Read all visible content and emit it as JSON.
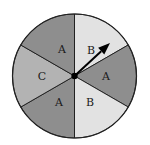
{
  "spinner": {
    "center": [
      74.5,
      76
    ],
    "radius": 62,
    "sectors": [
      {
        "label": "B",
        "start_deg": 0,
        "end_deg": 60,
        "color": "#e2e2e2",
        "label_pos": [
          91,
          50
        ]
      },
      {
        "label": "A",
        "start_deg": 60,
        "end_deg": 120,
        "color": "#8e8e8e",
        "label_pos": [
          106,
          76
        ]
      },
      {
        "label": "B",
        "start_deg": 120,
        "end_deg": 180,
        "color": "#e2e2e2",
        "label_pos": [
          90,
          102
        ]
      },
      {
        "label": "A",
        "start_deg": 180,
        "end_deg": 240,
        "color": "#8e8e8e",
        "label_pos": [
          59,
          102
        ]
      },
      {
        "label": "C",
        "start_deg": 240,
        "end_deg": 300,
        "color": "#b3b3b3",
        "label_pos": [
          42,
          76
        ]
      },
      {
        "label": "A",
        "start_deg": 300,
        "end_deg": 360,
        "color": "#8e8e8e",
        "label_pos": [
          62,
          49
        ]
      }
    ],
    "arrow": {
      "tip": [
        110,
        43
      ],
      "color": "#000000"
    },
    "outline_color": "#222222"
  }
}
